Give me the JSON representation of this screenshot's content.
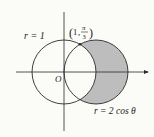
{
  "diagram": {
    "type": "polar-region",
    "colors": {
      "background": "#fbfbf7",
      "stroke": "#2a2a2a",
      "shade": "#bdbdbd"
    },
    "curves": [
      {
        "name": "circle-r1",
        "label": "r = 1"
      },
      {
        "name": "circle-r-2cos",
        "label": "r = 2 cos θ"
      }
    ],
    "origin_label": "O",
    "intersection_point": {
      "r": "1",
      "theta_num": "π",
      "theta_den": "3"
    },
    "shaded_region": "inside r = 2 cos θ, outside r = 1"
  }
}
